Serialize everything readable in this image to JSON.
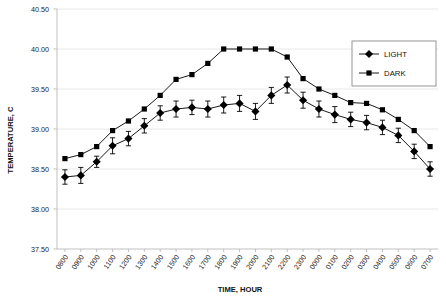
{
  "chart_data": {
    "type": "line",
    "title": "",
    "subtitle": "",
    "xlabel": "TIME, HOUR",
    "ylabel": "TEMPERATURE, C",
    "ylim": [
      37.5,
      40.5
    ],
    "ytick_step": 0.5,
    "ytick_labels": [
      "40.50",
      "40.00",
      "39.50",
      "39.00",
      "38.50",
      "38.00",
      "37.50"
    ],
    "ytick_values": [
      40.5,
      40.0,
      39.5,
      39.0,
      38.5,
      38.0,
      37.5
    ],
    "grid": "horizontal",
    "legend_position": "top-right",
    "categories": [
      "0800",
      "0900",
      "1000",
      "1100",
      "1200",
      "1300",
      "1400",
      "1500",
      "1600",
      "1700",
      "1800",
      "1900",
      "2000",
      "2100",
      "2200",
      "2300",
      "0000",
      "0100",
      "0200",
      "0300",
      "0400",
      "0500",
      "0600",
      "0700"
    ],
    "series": [
      {
        "name": "LIGHT",
        "marker": "diamond",
        "color": "#000000",
        "values": [
          38.4,
          38.42,
          38.59,
          38.79,
          38.88,
          39.04,
          39.2,
          39.25,
          39.27,
          39.25,
          39.3,
          39.32,
          39.22,
          39.42,
          39.55,
          39.36,
          39.25,
          39.18,
          39.12,
          39.08,
          39.02,
          38.92,
          38.72,
          38.5
        ],
        "errors": [
          0.09,
          0.1,
          0.07,
          0.1,
          0.09,
          0.09,
          0.09,
          0.1,
          0.09,
          0.1,
          0.1,
          0.1,
          0.1,
          0.1,
          0.1,
          0.1,
          0.1,
          0.1,
          0.09,
          0.09,
          0.09,
          0.09,
          0.09,
          0.09
        ]
      },
      {
        "name": "DARK",
        "marker": "square",
        "color": "#000000",
        "values": [
          38.63,
          38.68,
          38.78,
          38.98,
          39.1,
          39.25,
          39.42,
          39.62,
          39.68,
          39.82,
          40.0,
          40.0,
          40.0,
          40.0,
          39.9,
          39.63,
          39.5,
          39.42,
          39.33,
          39.32,
          39.24,
          39.12,
          38.98,
          38.78
        ],
        "errors": [
          0,
          0,
          0,
          0,
          0,
          0,
          0,
          0,
          0,
          0,
          0,
          0,
          0,
          0,
          0,
          0,
          0,
          0,
          0,
          0,
          0,
          0,
          0,
          0
        ]
      }
    ]
  },
  "legend": {
    "items": [
      {
        "label": "LIGHT"
      },
      {
        "label": "DARK"
      }
    ]
  },
  "axes": {
    "y_title": "TEMPERATURE, C",
    "x_title": "TIME, HOUR"
  }
}
